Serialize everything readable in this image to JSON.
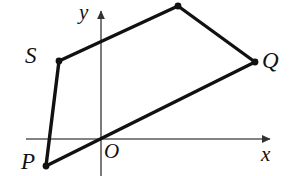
{
  "figure": {
    "type": "coordinate-geometry-diagram",
    "background_color": "#ffffff",
    "stroke_color": "#111111",
    "axis_color": "#5a5a5a",
    "canvas": {
      "width": 294,
      "height": 176
    }
  },
  "axes": {
    "x_axis": {
      "label": "x",
      "label_x": 261,
      "label_y": 144,
      "start_x": 26,
      "start_y": 139,
      "end_x": 276,
      "end_y": 139,
      "arrow": "right"
    },
    "y_axis": {
      "label": "y",
      "label_x": 79,
      "label_y": 2,
      "start_x": 101,
      "start_y": 176,
      "end_x": 101,
      "end_y": 5,
      "arrow": "up"
    },
    "origin": {
      "label": "O",
      "x": 101,
      "y": 139,
      "label_x": 104,
      "label_y": 141
    }
  },
  "polygon": {
    "name": "PQRS",
    "closed": true,
    "stroke_width": 3.4,
    "vertices": [
      {
        "id": "P",
        "label": "P",
        "x": 46,
        "y": 166,
        "label_x": 21,
        "label_y": 150,
        "dot": true,
        "labeled": true
      },
      {
        "id": "Q",
        "label": "Q",
        "x": 255,
        "y": 62,
        "label_x": 262,
        "label_y": 49,
        "dot": true,
        "labeled": true
      },
      {
        "id": "R",
        "label": "",
        "x": 178,
        "y": 6,
        "label_x": 0,
        "label_y": 0,
        "dot": true,
        "labeled": false
      },
      {
        "id": "S",
        "label": "S",
        "x": 59,
        "y": 61,
        "label_x": 25,
        "label_y": 44,
        "dot": true,
        "labeled": true
      }
    ],
    "edges": [
      {
        "from": "P",
        "to": "Q"
      },
      {
        "from": "Q",
        "to": "R"
      },
      {
        "from": "R",
        "to": "S"
      },
      {
        "from": "S",
        "to": "P"
      }
    ],
    "vertex_dot_radius": 3.4
  }
}
